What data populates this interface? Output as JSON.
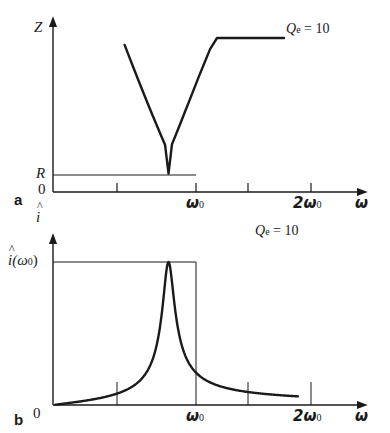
{
  "figure": {
    "type": "two-panel-line-plot",
    "background": "#ffffff",
    "ink": "#1a1a1a",
    "panels": [
      {
        "letter": "a",
        "y_axis_label": "Z",
        "x_axis_label": "ω",
        "y_origin_label": "0",
        "y_level_label": "R",
        "annotation": {
          "symbol": "Q",
          "subscript": "e",
          "equals": "=",
          "value": "10"
        },
        "x_tick_labels": [
          "ω",
          "2ω"
        ],
        "x_tick_sub": [
          "0",
          "0"
        ]
      },
      {
        "letter": "b",
        "y_axis_label": "i",
        "x_axis_label": "ω",
        "y_origin_label": "0",
        "y_level_label": "i(ω",
        "y_level_label_sub": "0",
        "y_level_label_tail": ")",
        "annotation": {
          "symbol": "Q",
          "subscript": "e",
          "equals": "=",
          "value": "10"
        },
        "x_tick_labels": [
          "ω",
          "2ω"
        ],
        "x_tick_sub": [
          "0",
          "0"
        ]
      }
    ]
  },
  "chart_data": {
    "type": "line",
    "title": "",
    "subtitle": "",
    "shared": {
      "xlabel": "ω",
      "xlim": [
        0,
        2.45
      ],
      "x_ticks": [
        0.5,
        1.0,
        1.5,
        2.0
      ],
      "x_tick_labels": [
        "",
        "ω0",
        "",
        "2ω0"
      ],
      "grid": false,
      "legend": "none",
      "quality_factor": 10,
      "annotation_text": "Qe = 10"
    },
    "panels": [
      {
        "id": "a",
        "ylabel": "Z",
        "ylim": [
          0,
          1.0
        ],
        "y_ticks": [
          0,
          0.12
        ],
        "y_tick_labels": [
          "0",
          "R"
        ],
        "description": "Impedance magnitude of series resonant circuit; V-shaped minimum equal to R at omega0",
        "minimum": {
          "x": 1.0,
          "y": 0.12,
          "label": "R"
        },
        "curve_x_range": [
          0.62,
          2.0
        ],
        "curve": {
          "x": [
            0.62,
            0.66,
            0.7,
            0.74,
            0.78,
            0.82,
            0.86,
            0.9,
            0.94,
            0.97,
            1.0,
            1.03,
            1.06,
            1.1,
            1.14,
            1.18,
            1.22,
            1.26,
            1.3,
            1.36,
            1.42,
            1.5,
            1.58,
            1.66,
            1.74,
            1.82,
            1.9,
            2.0
          ],
          "y": [
            0.955,
            0.877,
            0.8,
            0.724,
            0.649,
            0.575,
            0.502,
            0.43,
            0.359,
            0.307,
            0.12,
            0.31,
            0.365,
            0.44,
            0.516,
            0.592,
            0.668,
            0.744,
            0.818,
            0.928,
            1.0,
            1.0,
            1.0,
            1.0,
            1.0,
            1.0,
            1.0,
            1.0
          ]
        }
      },
      {
        "id": "b",
        "ylabel": "i",
        "ylim": [
          0,
          1.0
        ],
        "y_ticks": [
          0,
          1.0
        ],
        "y_tick_labels": [
          "0",
          "i(ω0)"
        ],
        "description": "Current amplitude resonance curve, Lorentzian peak of unit height at omega0",
        "peak": {
          "x": 1.0,
          "y": 1.0,
          "label": "i(ω0)"
        },
        "curve_x_range": [
          0.02,
          2.12
        ],
        "formula": "ihat = 1 / sqrt(1 + Q^2 (x - 1/x)^2), Q = 10"
      }
    ]
  }
}
